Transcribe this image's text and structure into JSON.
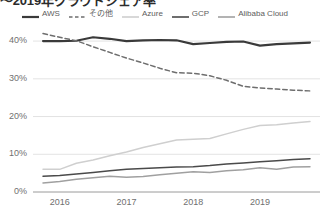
{
  "title": "〜2019年クラウドシェア率",
  "legend": {
    "position": "top",
    "items": [
      {
        "label": "AWS",
        "color": "#3a3a3a",
        "style": "solid",
        "width": 2.2
      },
      {
        "label": "その他",
        "color": "#6e6e6e",
        "style": "dashed",
        "width": 1.6
      },
      {
        "label": "Azure",
        "color": "#cfcfcf",
        "style": "solid",
        "width": 1.6
      },
      {
        "label": "GCP",
        "color": "#4a4a4a",
        "style": "solid",
        "width": 1.6
      },
      {
        "label": "Alibaba Cloud",
        "color": "#a0a0a0",
        "style": "solid",
        "width": 1.6
      }
    ]
  },
  "yaxis": {
    "ticks": [
      "0%",
      "10%",
      "20%",
      "30%",
      "40%"
    ],
    "tick_values": [
      0,
      10,
      20,
      30,
      40
    ],
    "min": 0,
    "max": 44
  },
  "xaxis": {
    "ticks": [
      "2016",
      "2017",
      "2018",
      "2019"
    ],
    "tick_values": [
      2016,
      2017,
      2018,
      2019
    ],
    "min": 2015.6,
    "max": 2019.9
  },
  "chart_data": {
    "type": "line",
    "title": "〜2019年クラウドシェア率",
    "xlabel": "",
    "ylabel": "",
    "xlim": [
      2015.6,
      2019.9
    ],
    "ylim": [
      0,
      44
    ],
    "grid": true,
    "legend_position": "top",
    "x": [
      2015.75,
      2016.0,
      2016.25,
      2016.5,
      2016.75,
      2017.0,
      2017.25,
      2017.5,
      2017.75,
      2018.0,
      2018.25,
      2018.5,
      2018.75,
      2019.0,
      2019.25,
      2019.5,
      2019.75
    ],
    "series": [
      {
        "name": "AWS",
        "color": "#3a3a3a",
        "style": "solid",
        "values": [
          40.0,
          40.0,
          40.1,
          41.0,
          40.6,
          40.0,
          40.2,
          40.3,
          40.2,
          39.2,
          39.5,
          39.8,
          39.9,
          38.8,
          39.2,
          39.4,
          39.6
        ]
      },
      {
        "name": "その他",
        "color": "#6e6e6e",
        "style": "dashed",
        "values": [
          42.0,
          41.0,
          40.1,
          38.5,
          37.0,
          35.5,
          34.2,
          32.8,
          31.6,
          31.5,
          30.8,
          29.6,
          28.0,
          27.6,
          27.3,
          27.0,
          26.8
        ]
      },
      {
        "name": "Azure",
        "color": "#cfcfcf",
        "style": "solid",
        "values": [
          6.0,
          6.0,
          7.6,
          8.5,
          9.6,
          10.6,
          11.8,
          12.8,
          13.8,
          14.0,
          14.2,
          15.4,
          16.6,
          17.6,
          17.8,
          18.3,
          18.7
        ]
      },
      {
        "name": "GCP",
        "color": "#4a4a4a",
        "style": "solid",
        "values": [
          4.2,
          4.4,
          4.8,
          5.2,
          5.6,
          6.0,
          6.2,
          6.4,
          6.6,
          6.7,
          7.0,
          7.4,
          7.7,
          8.0,
          8.3,
          8.6,
          8.8
        ]
      },
      {
        "name": "Alibaba Cloud",
        "color": "#a0a0a0",
        "style": "solid",
        "values": [
          2.4,
          2.8,
          3.4,
          3.8,
          4.2,
          3.9,
          4.1,
          4.6,
          5.0,
          5.4,
          5.2,
          5.6,
          5.9,
          6.4,
          6.0,
          6.6,
          6.7
        ]
      }
    ]
  }
}
